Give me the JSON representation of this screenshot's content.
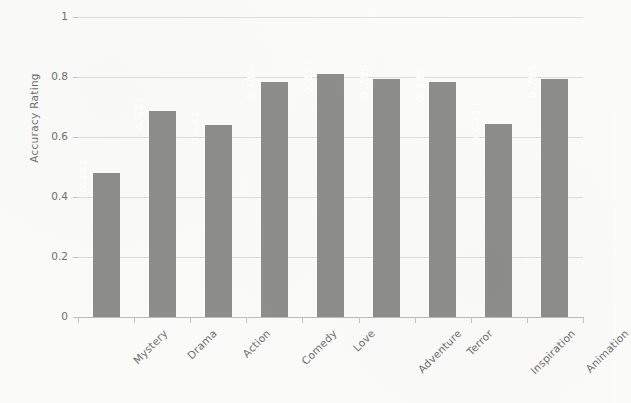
{
  "chart_data": {
    "type": "bar",
    "title": "",
    "xlabel": "",
    "ylabel": "Accuracy Rating",
    "categories": [
      "Mystery",
      "Drama",
      "Action",
      "Comedy",
      "Love",
      "Adventure",
      "Terror",
      "Inspiration",
      "Animation"
    ],
    "values": [
      0.481,
      0.687,
      0.641,
      0.785,
      0.811,
      0.795,
      0.785,
      0.643,
      0.795
    ],
    "value_labels": [
      "0.481",
      "0.687",
      "0.641",
      "0.785",
      "0.811",
      "0.795",
      "0.785",
      "0.643",
      "0.795"
    ],
    "ylim": [
      0,
      1
    ],
    "ytick_labels": [
      "0",
      "0.2",
      "0.4",
      "0.6",
      "0.8",
      "1"
    ],
    "ytick_values": [
      0,
      0.2,
      0.4,
      0.6,
      0.8,
      1
    ],
    "grid": true,
    "legend": "none",
    "bar_color": "#8d8d8b",
    "grid_color": "#dededa",
    "axis_color": "#bdbdb8",
    "label_color": "#70706d",
    "value_label_color": "#ffffff",
    "background_color": "#fbfbfa"
  }
}
